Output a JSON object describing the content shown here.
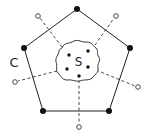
{
  "diagram": {
    "labels": {
      "outer_set": "C",
      "inner_set": "S"
    },
    "colors": {
      "stroke": "#222222",
      "background": "#ffffff"
    },
    "pentagon_vertices": [
      [
        77,
        9
      ],
      [
        130,
        48
      ],
      [
        109,
        111
      ],
      [
        43,
        111
      ],
      [
        24,
        48
      ]
    ],
    "open_points": [
      [
        38,
        16
      ],
      [
        116,
        16
      ],
      [
        138,
        87
      ],
      [
        79,
        127
      ],
      [
        15,
        82
      ]
    ],
    "inner_points": [
      [
        69,
        55
      ],
      [
        88,
        51
      ],
      [
        67,
        69
      ],
      [
        88,
        67
      ],
      [
        79,
        76
      ]
    ]
  }
}
